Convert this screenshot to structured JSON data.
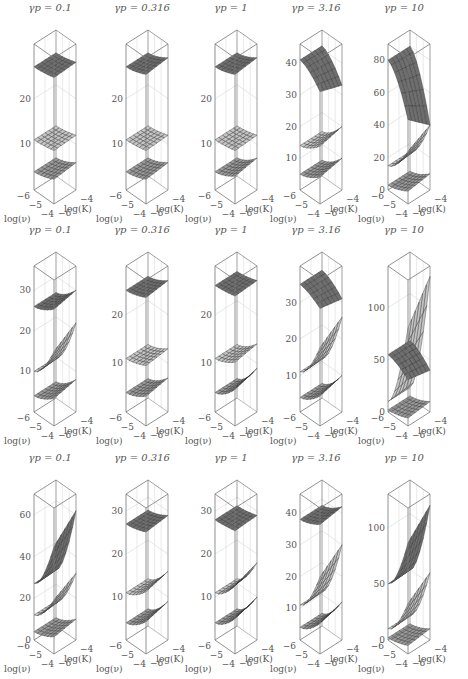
{
  "chart_data": {
    "type": "surface3d-grid",
    "rows": 3,
    "cols": 5,
    "x_axis_label": "log(ν)",
    "y_axis_label": "log(K)",
    "x_ticks": [
      "-6",
      "-5",
      "-4"
    ],
    "y_ticks": [
      "-6",
      "-4"
    ],
    "panels": [
      {
        "row": 0,
        "col": 0,
        "title": "γp = 0.1",
        "gamma_p": 0.1,
        "z_ticks": [
          10,
          20
        ],
        "zlim": [
          0,
          32
        ],
        "surfaces": [
          {
            "z": [
              27,
              28
            ],
            "shade": "dark"
          },
          {
            "z": [
              11,
              12
            ],
            "shade": "light"
          },
          {
            "z": [
              4,
              6
            ],
            "shade": "mid"
          }
        ]
      },
      {
        "row": 0,
        "col": 1,
        "title": "γp = 0.316",
        "gamma_p": 0.316,
        "z_ticks": [
          10,
          20
        ],
        "zlim": [
          0,
          32
        ],
        "surfaces": [
          {
            "z": [
              27,
              29
            ],
            "shade": "dark"
          },
          {
            "z": [
              11,
              12
            ],
            "shade": "light"
          },
          {
            "z": [
              4,
              6
            ],
            "shade": "mid"
          }
        ]
      },
      {
        "row": 0,
        "col": 2,
        "title": "γp = 1",
        "gamma_p": 1,
        "z_ticks": [
          10,
          20
        ],
        "zlim": [
          0,
          32
        ],
        "surfaces": [
          {
            "z": [
              27,
              29
            ],
            "shade": "dark"
          },
          {
            "z": [
              11,
              12
            ],
            "shade": "light"
          },
          {
            "z": [
              4,
              7
            ],
            "shade": "mid"
          }
        ]
      },
      {
        "row": 0,
        "col": 3,
        "title": "γp = 3.16",
        "gamma_p": 3.16,
        "z_ticks": [
          10,
          20,
          30,
          40
        ],
        "zlim": [
          0,
          46
        ],
        "surfaces": [
          {
            "z": [
              41,
              33
            ],
            "shade": "dark"
          },
          {
            "z": [
              14,
              20
            ],
            "shade": "light"
          },
          {
            "z": [
              5,
              10
            ],
            "shade": "mid"
          }
        ]
      },
      {
        "row": 0,
        "col": 4,
        "title": "γp = 10",
        "gamma_p": 10,
        "z_ticks": [
          0,
          20,
          40,
          60,
          80
        ],
        "zlim": [
          0,
          90
        ],
        "surfaces": [
          {
            "z": [
              80,
              40
            ],
            "shade": "dark"
          },
          {
            "z": [
              15,
              40
            ],
            "shade": "light"
          },
          {
            "z": [
              3,
              10
            ],
            "shade": "mid"
          }
        ]
      },
      {
        "row": 1,
        "col": 0,
        "title": "γp = 0.1",
        "gamma_p": 0.1,
        "z_ticks": [
          10,
          20,
          30
        ],
        "zlim": [
          0,
          36
        ],
        "surfaces": [
          {
            "z": [
              26,
              30
            ],
            "shade": "dark"
          },
          {
            "z": [
              10,
              22
            ],
            "shade": "light"
          },
          {
            "z": [
              4,
              8
            ],
            "shade": "mid"
          }
        ]
      },
      {
        "row": 1,
        "col": 1,
        "title": "γp = 0.316",
        "gamma_p": 0.316,
        "z_ticks": [
          10,
          20
        ],
        "zlim": [
          0,
          30
        ],
        "surfaces": [
          {
            "z": [
              25,
              27
            ],
            "shade": "dark"
          },
          {
            "z": [
              11,
              13
            ],
            "shade": "light"
          },
          {
            "z": [
              4,
              7
            ],
            "shade": "mid"
          }
        ]
      },
      {
        "row": 1,
        "col": 2,
        "title": "γp = 1",
        "gamma_p": 1,
        "z_ticks": [
          10,
          20
        ],
        "zlim": [
          0,
          30
        ],
        "surfaces": [
          {
            "z": [
              26,
              27
            ],
            "shade": "dark"
          },
          {
            "z": [
              11,
              14
            ],
            "shade": "light"
          },
          {
            "z": [
              4,
              9
            ],
            "shade": "mid"
          }
        ]
      },
      {
        "row": 1,
        "col": 3,
        "title": "γp = 3.16",
        "gamma_p": 3.16,
        "z_ticks": [
          10,
          20,
          30
        ],
        "zlim": [
          0,
          40
        ],
        "surfaces": [
          {
            "z": [
              35,
              31
            ],
            "shade": "dark"
          },
          {
            "z": [
              11,
              26
            ],
            "shade": "light"
          },
          {
            "z": [
              4,
              10
            ],
            "shade": "mid"
          }
        ]
      },
      {
        "row": 1,
        "col": 4,
        "title": "γp = 10",
        "gamma_p": 10,
        "z_ticks": [
          0,
          50,
          100
        ],
        "zlim": [
          0,
          140
        ],
        "surfaces": [
          {
            "z": [
              55,
              40
            ],
            "shade": "dark"
          },
          {
            "z": [
              10,
              130
            ],
            "shade": "light"
          },
          {
            "z": [
              2,
              10
            ],
            "shade": "mid"
          }
        ]
      },
      {
        "row": 2,
        "col": 0,
        "title": "γp = 0.1",
        "gamma_p": 0.1,
        "z_ticks": [
          0,
          20,
          40,
          60
        ],
        "zlim": [
          0,
          70
        ],
        "surfaces": [
          {
            "z": [
              27,
              62
            ],
            "shade": "dark"
          },
          {
            "z": [
              12,
              32
            ],
            "shade": "light"
          },
          {
            "z": [
              4,
              10
            ],
            "shade": "mid"
          }
        ]
      },
      {
        "row": 2,
        "col": 1,
        "title": "γp = 0.316",
        "gamma_p": 0.316,
        "z_ticks": [
          10,
          20,
          30
        ],
        "zlim": [
          0,
          34
        ],
        "surfaces": [
          {
            "z": [
              27,
              29
            ],
            "shade": "dark"
          },
          {
            "z": [
              11,
              16
            ],
            "shade": "light"
          },
          {
            "z": [
              4,
              9
            ],
            "shade": "mid"
          }
        ]
      },
      {
        "row": 2,
        "col": 2,
        "title": "γp = 1",
        "gamma_p": 1,
        "z_ticks": [
          10,
          20,
          30
        ],
        "zlim": [
          0,
          34
        ],
        "surfaces": [
          {
            "z": [
              28,
              29
            ],
            "shade": "dark"
          },
          {
            "z": [
              11,
              18
            ],
            "shade": "light"
          },
          {
            "z": [
              4,
              10
            ],
            "shade": "mid"
          }
        ]
      },
      {
        "row": 2,
        "col": 3,
        "title": "γp = 3.16",
        "gamma_p": 3.16,
        "z_ticks": [
          10,
          20,
          30,
          40
        ],
        "zlim": [
          0,
          46
        ],
        "surfaces": [
          {
            "z": [
              38,
              42
            ],
            "shade": "dark"
          },
          {
            "z": [
              11,
              30
            ],
            "shade": "light"
          },
          {
            "z": [
              4,
              12
            ],
            "shade": "mid"
          }
        ]
      },
      {
        "row": 2,
        "col": 4,
        "title": "γp = 10",
        "gamma_p": 10,
        "z_ticks": [
          0,
          50,
          100
        ],
        "zlim": [
          0,
          130
        ],
        "surfaces": [
          {
            "z": [
              50,
              120
            ],
            "shade": "dark"
          },
          {
            "z": [
              10,
              60
            ],
            "shade": "light"
          },
          {
            "z": [
              2,
              10
            ],
            "shade": "mid"
          }
        ]
      }
    ]
  },
  "colors": {
    "dark": "#6e6e6e",
    "mid": "#9a9a9a",
    "light": "#c4c4c4",
    "box": "#777",
    "grid": "#dcdcdc",
    "mesh": "#333"
  }
}
